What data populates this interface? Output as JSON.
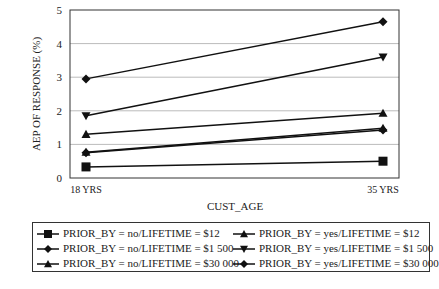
{
  "chart_data": {
    "type": "line",
    "title": "",
    "xlabel": "CUST_AGE",
    "ylabel": "AEP OF RESPONSE (%)",
    "categories": [
      "18 YRS",
      "35 YRS"
    ],
    "ylim": [
      0,
      5
    ],
    "yticks": [
      0,
      1,
      2,
      3,
      4,
      5
    ],
    "grid": "horizontal",
    "legend_position": "bottom",
    "series": [
      {
        "name": "PRIOR_BY = no/LIFETIME = $12",
        "marker": "square",
        "values": [
          0.33,
          0.5
        ]
      },
      {
        "name": "PRIOR_BY = no/LIFETIME = $1 500",
        "marker": "diamond",
        "values": [
          2.95,
          4.65
        ]
      },
      {
        "name": "PRIOR_BY = no/LIFETIME = $30 000",
        "marker": "triangle-up",
        "values": [
          0.77,
          1.48
        ]
      },
      {
        "name": "PRIOR_BY = yes/LIFETIME = $12",
        "marker": "triangle-up",
        "values": [
          1.3,
          1.93
        ]
      },
      {
        "name": "PRIOR_BY = yes/LIFETIME = $1 500",
        "marker": "triangle-down",
        "values": [
          1.85,
          3.6
        ]
      },
      {
        "name": "PRIOR_BY = yes/LIFETIME = $30 000",
        "marker": "diamond",
        "values": [
          0.75,
          1.43
        ]
      }
    ]
  },
  "legend": {
    "items": [
      {
        "label": "PRIOR_BY = no/LIFETIME = $12",
        "marker": "square"
      },
      {
        "label": "PRIOR_BY = yes/LIFETIME = $12",
        "marker": "triangle-up"
      },
      {
        "label": "PRIOR_BY = no/LIFETIME = $1 500",
        "marker": "diamond"
      },
      {
        "label": "PRIOR_BY = yes/LIFETIME = $1 500",
        "marker": "triangle-down"
      },
      {
        "label": "PRIOR_BY = no/LIFETIME = $30 000",
        "marker": "triangle-up"
      },
      {
        "label": "PRIOR_BY = yes/LIFETIME = $30 000",
        "marker": "diamond"
      }
    ]
  },
  "colors": {
    "line": "#111111",
    "grid": "#bbbbbb",
    "axis": "#333333"
  }
}
